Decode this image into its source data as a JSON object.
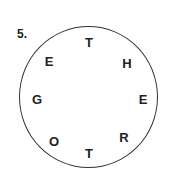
{
  "puzzle": {
    "number": "5.",
    "letters": [
      {
        "char": "T",
        "x": 89,
        "y": 42
      },
      {
        "char": "H",
        "x": 127,
        "y": 63
      },
      {
        "char": "E",
        "x": 143,
        "y": 99
      },
      {
        "char": "R",
        "x": 124,
        "y": 137
      },
      {
        "char": "T",
        "x": 89,
        "y": 153
      },
      {
        "char": "O",
        "x": 54,
        "y": 141
      },
      {
        "char": "G",
        "x": 37,
        "y": 99
      },
      {
        "char": "E",
        "x": 49,
        "y": 61
      }
    ]
  }
}
